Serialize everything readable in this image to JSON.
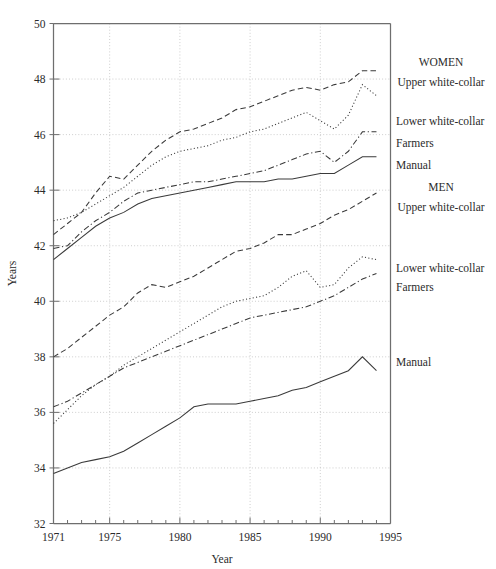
{
  "chart_data": {
    "type": "line",
    "title": "",
    "xlabel": "Year",
    "ylabel": "Years",
    "xlim": [
      1971,
      1995
    ],
    "ylim": [
      32,
      50
    ],
    "xticks": [
      1971,
      1975,
      1980,
      1985,
      1990,
      1995
    ],
    "xtick_labels": [
      "1971",
      "1975",
      "1980",
      "1985",
      "1990",
      "1995"
    ],
    "xminor_step": 1,
    "yticks": [
      32,
      34,
      36,
      38,
      40,
      42,
      44,
      46,
      48,
      50
    ],
    "ytick_labels": [
      "32",
      "34",
      "36",
      "38",
      "40",
      "42",
      "44",
      "46",
      "48",
      "50"
    ],
    "grid": true,
    "grid_axes": "both",
    "legend_position": "right-outside",
    "legend_groups": [
      {
        "heading": "WOMEN",
        "entries": [
          "Upper white-collar",
          "Lower white-collar",
          "Farmers",
          "Manual"
        ]
      },
      {
        "heading": "MEN",
        "entries": [
          "Upper white-collar",
          "Lower white-collar",
          "Farmers",
          "Manual"
        ]
      }
    ],
    "x": [
      1971,
      1972,
      1973,
      1974,
      1975,
      1976,
      1977,
      1978,
      1979,
      1980,
      1981,
      1982,
      1983,
      1984,
      1985,
      1986,
      1987,
      1988,
      1989,
      1990,
      1991,
      1992,
      1993,
      1994
    ],
    "series": [
      {
        "name": "Women Upper white-collar",
        "group": "WOMEN",
        "style": "dashed",
        "values": [
          42.4,
          42.8,
          43.2,
          43.9,
          44.5,
          44.4,
          44.9,
          45.4,
          45.8,
          46.1,
          46.2,
          46.4,
          46.6,
          46.9,
          47.0,
          47.2,
          47.4,
          47.6,
          47.7,
          47.6,
          47.8,
          47.9,
          48.3,
          48.3
        ]
      },
      {
        "name": "Women Lower white-collar",
        "group": "WOMEN",
        "style": "dotted",
        "values": [
          42.9,
          43.0,
          43.2,
          43.5,
          43.8,
          44.1,
          44.5,
          44.9,
          45.2,
          45.4,
          45.5,
          45.6,
          45.8,
          45.9,
          46.1,
          46.2,
          46.4,
          46.6,
          46.8,
          46.5,
          46.2,
          46.7,
          47.8,
          47.4
        ]
      },
      {
        "name": "Women Farmers",
        "group": "WOMEN",
        "style": "dashdot",
        "values": [
          41.9,
          42.0,
          42.5,
          42.9,
          43.2,
          43.6,
          43.9,
          44.0,
          44.1,
          44.2,
          44.3,
          44.3,
          44.4,
          44.5,
          44.6,
          44.7,
          44.9,
          45.1,
          45.3,
          45.4,
          45.0,
          45.4,
          46.1,
          46.1
        ]
      },
      {
        "name": "Women Manual",
        "group": "WOMEN",
        "style": "solid",
        "values": [
          41.5,
          41.9,
          42.3,
          42.7,
          43.0,
          43.2,
          43.5,
          43.7,
          43.8,
          43.9,
          44.0,
          44.1,
          44.2,
          44.3,
          44.3,
          44.3,
          44.4,
          44.4,
          44.5,
          44.6,
          44.6,
          44.9,
          45.2,
          45.2
        ]
      },
      {
        "name": "Men Upper white-collar",
        "group": "MEN",
        "style": "dashed",
        "values": [
          38.0,
          38.3,
          38.7,
          39.1,
          39.5,
          39.8,
          40.3,
          40.6,
          40.5,
          40.7,
          40.9,
          41.2,
          41.5,
          41.8,
          41.9,
          42.1,
          42.4,
          42.4,
          42.6,
          42.8,
          43.1,
          43.3,
          43.6,
          43.9
        ]
      },
      {
        "name": "Men Lower white-collar",
        "group": "MEN",
        "style": "dotted",
        "values": [
          35.6,
          36.1,
          36.6,
          37.0,
          37.3,
          37.7,
          38.0,
          38.3,
          38.6,
          38.9,
          39.2,
          39.5,
          39.8,
          40.0,
          40.1,
          40.2,
          40.5,
          40.9,
          41.1,
          40.5,
          40.6,
          41.2,
          41.6,
          41.5
        ]
      },
      {
        "name": "Men Farmers",
        "group": "MEN",
        "style": "dashdot",
        "values": [
          36.2,
          36.4,
          36.7,
          37.0,
          37.3,
          37.6,
          37.8,
          38.0,
          38.2,
          38.4,
          38.6,
          38.8,
          39.0,
          39.2,
          39.4,
          39.5,
          39.6,
          39.7,
          39.8,
          40.0,
          40.2,
          40.5,
          40.8,
          41.0
        ]
      },
      {
        "name": "Men Manual",
        "group": "MEN",
        "style": "solid",
        "values": [
          33.8,
          34.0,
          34.2,
          34.3,
          34.4,
          34.6,
          34.9,
          35.2,
          35.5,
          35.8,
          36.2,
          36.3,
          36.3,
          36.3,
          36.4,
          36.5,
          36.6,
          36.8,
          36.9,
          37.1,
          37.3,
          37.5,
          38.0,
          37.5
        ]
      }
    ],
    "legend_anchor_values": {
      "women_heading": 48.6,
      "women_upper": 47.9,
      "women_lower": 46.5,
      "women_farmers": 45.7,
      "women_manual": 44.9,
      "men_heading": 44.1,
      "men_upper": 43.4,
      "men_lower": 41.2,
      "men_farmers": 40.5,
      "men_manual": 37.8
    },
    "colors": {
      "line": "#3a3a3a",
      "grid": "#b9b9b9",
      "frame": "#6e6e6e",
      "text": "#2b2b2b",
      "background": "#ffffff"
    }
  }
}
